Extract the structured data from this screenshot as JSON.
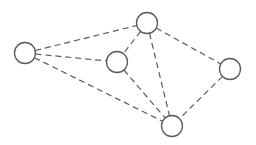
{
  "diagram": {
    "type": "undirected-graph",
    "edge_style": "dashed",
    "colors": {
      "stroke": "#5a5a5a",
      "node_fill": "#ffffff",
      "background": "#ffffff"
    },
    "node_radius": 10.5,
    "nodes": [
      {
        "id": "left",
        "x": 25,
        "y": 53
      },
      {
        "id": "top",
        "x": 147,
        "y": 23
      },
      {
        "id": "middle",
        "x": 117,
        "y": 62
      },
      {
        "id": "right",
        "x": 230,
        "y": 69
      },
      {
        "id": "bottom",
        "x": 172,
        "y": 126
      }
    ],
    "edges": [
      [
        "left",
        "top"
      ],
      [
        "left",
        "middle"
      ],
      [
        "left",
        "bottom"
      ],
      [
        "top",
        "middle"
      ],
      [
        "top",
        "bottom"
      ],
      [
        "top",
        "right"
      ],
      [
        "middle",
        "bottom"
      ],
      [
        "right",
        "bottom"
      ]
    ]
  }
}
